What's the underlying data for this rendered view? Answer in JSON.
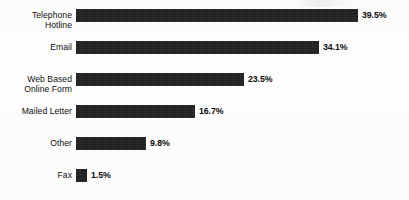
{
  "chart_data": {
    "type": "bar",
    "orientation": "horizontal",
    "title": "",
    "xlabel": "",
    "ylabel": "",
    "grid": false,
    "legend": "none",
    "xlim": [
      0,
      39.5
    ],
    "value_suffix": "%",
    "categories": [
      "Telephone\nHotline",
      "Email",
      "Web Based\nOnline Form",
      "Mailed Letter",
      "Other",
      "Fax"
    ],
    "values": [
      39.5,
      34.1,
      23.5,
      16.7,
      9.8,
      1.5
    ],
    "value_labels": [
      "39.5%",
      "34.1%",
      "23.5%",
      "16.7%",
      "9.8%",
      "1.5%"
    ],
    "bar_color": "#1c1c1c",
    "background_color": "#fdfdfc"
  },
  "rows": [
    {
      "label": "Telephone\nHotline",
      "value": 39.5,
      "value_label": "39.5%"
    },
    {
      "label": "Email",
      "value": 34.1,
      "value_label": "34.1%"
    },
    {
      "label": "Web Based\nOnline Form",
      "value": 23.5,
      "value_label": "23.5%"
    },
    {
      "label": "Mailed Letter",
      "value": 16.7,
      "value_label": "16.7%"
    },
    {
      "label": "Other",
      "value": 9.8,
      "value_label": "9.8%"
    },
    {
      "label": "Fax",
      "value": 1.5,
      "value_label": "1.5%"
    }
  ]
}
